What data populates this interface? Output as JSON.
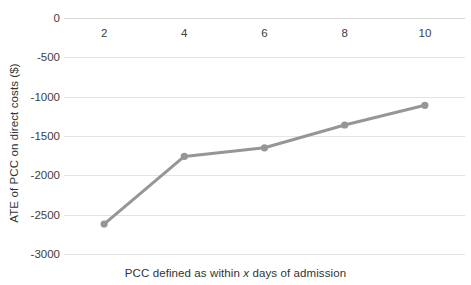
{
  "chart_data": {
    "type": "line",
    "title": "",
    "xlabel": "PCC defined as within x days of admission",
    "xlabel_parts": {
      "before": "PCC defined as within ",
      "italic": "x",
      "after": " days of admission"
    },
    "ylabel": "ATE of PCC on direct costs ($)",
    "x": [
      2,
      4,
      6,
      8,
      10
    ],
    "values": [
      -2620,
      -1760,
      -1650,
      -1360,
      -1110
    ],
    "series": [
      {
        "name": "ATE of PCC on direct costs",
        "values": [
          -2620,
          -1760,
          -1650,
          -1360,
          -1110
        ]
      }
    ],
    "xtick_labels": [
      "2",
      "4",
      "6",
      "8",
      "10"
    ],
    "ytick_labels": [
      "0",
      "-500",
      "-1000",
      "-1500",
      "-2000",
      "-2500",
      "-3000"
    ],
    "ytick_values": [
      0,
      -500,
      -1000,
      -1500,
      -2000,
      -2500,
      -3000
    ],
    "xlim": [
      1,
      11
    ],
    "ylim": [
      -3000,
      0
    ],
    "grid": "horizontal",
    "legend": "none",
    "line_color": "#969696",
    "marker": "circle",
    "marker_color": "#969696"
  },
  "colors": {
    "line": "#969696",
    "marker": "#969696",
    "gridline": "#e4e4e4",
    "zero_gridline": "#d9d9d9",
    "tick_text": "#404040",
    "axis_title_text": "#333333",
    "background": "#ffffff"
  }
}
